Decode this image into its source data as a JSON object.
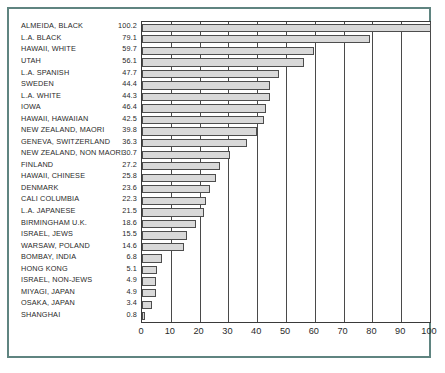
{
  "figure": {
    "frame_color": "#5f8480",
    "background": "#ffffff",
    "bar_fill": "#d9d9d9",
    "bar_stroke": "#4d4d4d",
    "axis_color": "#3a3a3a"
  },
  "chart_data": {
    "type": "bar",
    "orientation": "horizontal",
    "title": "",
    "xlabel": "",
    "ylabel": "",
    "xlim": [
      0,
      100
    ],
    "xticks": [
      0,
      10,
      20,
      30,
      40,
      50,
      60,
      70,
      80,
      90,
      100
    ],
    "grid": true,
    "legend": "none",
    "value_labels_shown": true,
    "categories": [
      "ALMEIDA, BLACK",
      "L.A. BLACK",
      "HAWAII, WHITE",
      "UTAH",
      "L.A. SPANISH",
      "SWEDEN",
      "L.A. WHITE",
      "IOWA",
      "HAWAII, HAWAIIAN",
      "NEW ZEALAND, MAORI",
      "GENEVA, SWITZERLAND",
      "NEW ZEALAND, NON MAORI",
      "FINLAND",
      "HAWAII, CHINESE",
      "DENMARK",
      "CALI COLUMBIA",
      "L.A. JAPANESE",
      "BIRMINGHAM U.K.",
      "ISRAEL, JEWS",
      "WARSAW, POLAND",
      "BOMBAY, INDIA",
      "HONG KONG",
      "ISRAEL, NON-JEWS",
      "MIYAGI, JAPAN",
      "OSAKA, JAPAN",
      "SHANGHAI"
    ],
    "values": [
      100.2,
      79.1,
      59.7,
      56.1,
      47.7,
      44.4,
      44.3,
      46.4,
      42.5,
      39.8,
      36.3,
      30.7,
      27.2,
      25.8,
      23.6,
      22.3,
      21.5,
      18.6,
      15.5,
      14.6,
      6.8,
      5.1,
      4.9,
      4.9,
      3.4,
      0.8
    ],
    "bar_lengths": [
      100.2,
      79.1,
      59.7,
      56.1,
      47.7,
      44.4,
      44.3,
      43.0,
      42.5,
      39.8,
      36.3,
      30.7,
      27.2,
      25.8,
      23.6,
      22.3,
      21.5,
      18.6,
      15.5,
      14.6,
      6.8,
      5.1,
      4.9,
      4.9,
      3.4,
      0.8
    ],
    "value_label_strings": [
      "100.2",
      "79.1",
      "59.7",
      "56.1",
      "47.7",
      "44.4",
      "44.3",
      "46.4",
      "42.5",
      "39.8",
      "36.3",
      "30.7",
      "27.2",
      "25.8",
      "23.6",
      "22.3",
      "21.5",
      "18.6",
      "15.5",
      "14.6",
      "6.8",
      "5.1",
      "4.9",
      "4.9",
      "3.4",
      "0.8"
    ],
    "xtick_labels": [
      "0",
      "10",
      "20",
      "30",
      "40",
      "50",
      "60",
      "70",
      "80",
      "90",
      "100"
    ]
  }
}
